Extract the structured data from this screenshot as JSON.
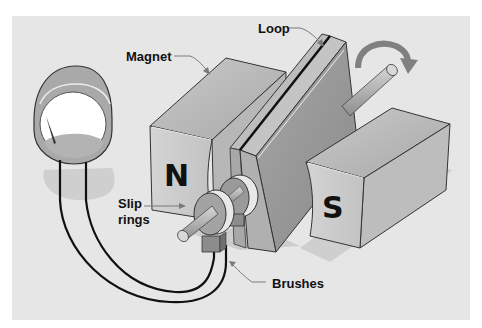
{
  "diagram": {
    "colors": {
      "page_background": "#ffffff",
      "panel_background": "#e6e6e6",
      "magnet_front": "#cfcfcf",
      "magnet_top": "#b9b9b9",
      "magnet_side": "#a8a8a8",
      "loop_face": "#9e9e9e",
      "loop_edge": "#bdbdbd",
      "wire": "#111111",
      "leader_line": "#7a7a7a",
      "rotation_arrow": "#7f7f7f"
    },
    "labels": {
      "magnet": "Magnet",
      "loop": "Loop",
      "slip_rings_line1": "Slip",
      "slip_rings_line2": "rings",
      "brushes": "Brushes"
    },
    "poles": {
      "north": "N",
      "south": "S"
    },
    "components": [
      "galvanometer",
      "north-magnet",
      "south-magnet",
      "wire-loop",
      "axle",
      "slip-rings",
      "brushes",
      "connecting-wires",
      "rotation-arrow"
    ]
  }
}
